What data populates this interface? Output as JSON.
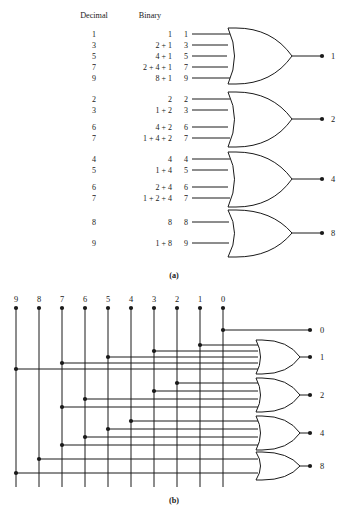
{
  "figure": {
    "title_a_caption": "(a)",
    "title_b_caption": "(b)"
  },
  "part_a": {
    "headers": {
      "decimal": "Decimal",
      "binary": "Binary"
    },
    "groups": [
      {
        "output": "1",
        "rows": [
          {
            "decimal": "1",
            "binary": "1",
            "input": "1"
          },
          {
            "decimal": "3",
            "binary": "2 + 1",
            "input": "3"
          },
          {
            "decimal": "5",
            "binary": "4 + 1",
            "input": "5"
          },
          {
            "decimal": "7",
            "binary": "2 + 4 + 1",
            "input": "7"
          },
          {
            "decimal": "9",
            "binary": "8 + 1",
            "input": "9"
          }
        ]
      },
      {
        "output": "2",
        "rows": [
          {
            "decimal": "2",
            "binary": "2",
            "input": "2"
          },
          {
            "decimal": "3",
            "binary": "1 + 2",
            "input": "3"
          },
          {
            "decimal": "6",
            "binary": "4 + 2",
            "input": "6"
          },
          {
            "decimal": "7",
            "binary": "1 + 4 + 2",
            "input": "7"
          }
        ]
      },
      {
        "output": "4",
        "rows": [
          {
            "decimal": "4",
            "binary": "4",
            "input": "4"
          },
          {
            "decimal": "5",
            "binary": "1 + 4",
            "input": "5"
          },
          {
            "decimal": "6",
            "binary": "2 + 4",
            "input": "6"
          },
          {
            "decimal": "7",
            "binary": "1 + 2 + 4",
            "input": "7"
          }
        ]
      },
      {
        "output": "8",
        "rows": [
          {
            "decimal": "8",
            "binary": "8",
            "input": "8"
          },
          {
            "decimal": "9",
            "binary": "1 + 8",
            "input": "9"
          }
        ]
      }
    ]
  },
  "part_b": {
    "column_labels": [
      "9",
      "8",
      "7",
      "6",
      "5",
      "4",
      "3",
      "2",
      "1",
      "0"
    ],
    "outputs": [
      {
        "label": "0",
        "connects": [
          0
        ]
      },
      {
        "label": "1",
        "connects": [
          1,
          3,
          5,
          7,
          9
        ]
      },
      {
        "label": "2",
        "connects": [
          2,
          3,
          6,
          7
        ]
      },
      {
        "label": "4",
        "connects": [
          4,
          5,
          6,
          7
        ]
      },
      {
        "label": "8",
        "connects": [
          8,
          9
        ]
      }
    ]
  },
  "colors": {
    "ink": "#1a1a1a",
    "background": "#ffffff"
  }
}
